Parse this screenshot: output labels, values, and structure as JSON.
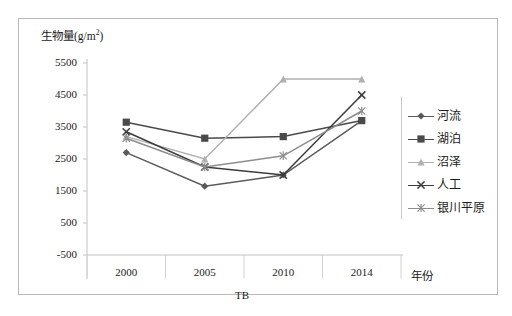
{
  "axis": {
    "y_title_main": "生物量(g/m",
    "y_title_sup": "2",
    "y_title_tail": ")",
    "x_title": "年份",
    "x_sub_label": "TB"
  },
  "chart_data": {
    "type": "line",
    "title": "",
    "xlabel": "年份",
    "ylabel": "生物量(g/m2)",
    "categories": [
      "2000",
      "2005",
      "2010",
      "2014"
    ],
    "x": [
      2000,
      2005,
      2010,
      2014
    ],
    "ylim": [
      -500,
      5500
    ],
    "yticks": [
      -500,
      500,
      1500,
      2500,
      3500,
      4500,
      5500
    ],
    "grid": false,
    "legend_position": "right",
    "series": [
      {
        "name": "河流",
        "marker": "diamond",
        "color": "#5a5a5a",
        "values": [
          2700,
          1650,
          2000,
          3700
        ]
      },
      {
        "name": "湖泊",
        "marker": "square",
        "color": "#4a4a4a",
        "values": [
          3650,
          3150,
          3200,
          3700
        ]
      },
      {
        "name": "沼泽",
        "marker": "triangle",
        "color": "#b0b0b0",
        "values": [
          3200,
          2500,
          5000,
          5000
        ]
      },
      {
        "name": "人工",
        "marker": "cross",
        "color": "#3c3c3c",
        "values": [
          3350,
          2250,
          2000,
          4500
        ]
      },
      {
        "name": "银川平原",
        "marker": "star",
        "color": "#8c8c8c",
        "values": [
          3150,
          2250,
          2600,
          4000
        ]
      }
    ]
  },
  "legend": {
    "items": [
      {
        "label": "河流",
        "marker": "diamond-icon",
        "color": "#5a5a5a"
      },
      {
        "label": "湖泊",
        "marker": "square-icon",
        "color": "#4a4a4a"
      },
      {
        "label": "沼泽",
        "marker": "triangle-icon",
        "color": "#b0b0b0"
      },
      {
        "label": "人工",
        "marker": "cross-icon",
        "color": "#3c3c3c"
      },
      {
        "label": "银川平原",
        "marker": "star-icon",
        "color": "#8c8c8c"
      }
    ]
  },
  "yticklabels": [
    "5500",
    "4500",
    "3500",
    "2500",
    "1500",
    "500",
    "-500"
  ],
  "xticklabels": [
    "2000",
    "2005",
    "2010",
    "2014"
  ]
}
